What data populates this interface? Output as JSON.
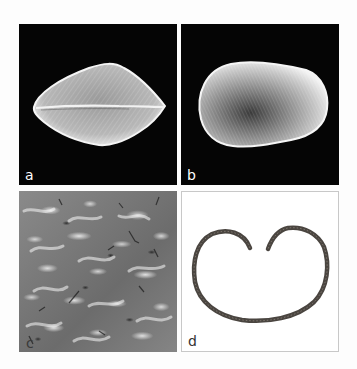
{
  "figure": {
    "panels": [
      {
        "id": "a",
        "label": "a",
        "content": "SEM image of seed, view showing longitudinal groove",
        "background": "#050505"
      },
      {
        "id": "b",
        "label": "b",
        "content": "SEM image of seed, lateral view",
        "background": "#050505"
      },
      {
        "id": "c",
        "label": "c",
        "content": "SEM close-up of seed coat surface texture",
        "background": "#7a7a7a"
      },
      {
        "id": "d",
        "label": "d",
        "content": "Light micrograph of seed cross-section (heart-shaped ring)",
        "background": "#ffffff"
      }
    ],
    "colors": {
      "sem_background": "#050505",
      "seed_surface": "#d9d9d9",
      "texture_gray": "#7a7a7a",
      "section_stroke": "#4a4540",
      "panel_d_border": "#c8c8c8"
    }
  }
}
